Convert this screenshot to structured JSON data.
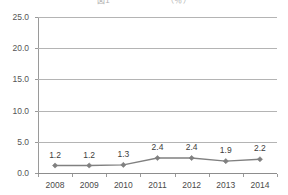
{
  "chart_data": {
    "type": "line",
    "title": "図1　　　　　　　（％）",
    "xlabel": "",
    "ylabel": "",
    "categories": [
      "2008",
      "2009",
      "2010",
      "2011",
      "2012",
      "2013",
      "2014"
    ],
    "values": [
      1.2,
      1.2,
      1.3,
      2.4,
      2.4,
      1.9,
      2.2
    ],
    "point_labels": [
      "1.2",
      "1.2",
      "1.3",
      "2.4",
      "2.4",
      "1.9",
      "2.2"
    ],
    "ylim": [
      0.0,
      25.0
    ],
    "yticks": [
      0.0,
      5.0,
      10.0,
      15.0,
      20.0,
      25.0
    ],
    "ytick_labels": [
      "0.0",
      "5.0",
      "10.0",
      "15.0",
      "20.0",
      "25.0"
    ],
    "grid": true,
    "legend": null,
    "series": [
      {
        "name": "series-1",
        "values": [
          1.2,
          1.2,
          1.3,
          2.4,
          2.4,
          1.9,
          2.2
        ],
        "color": "#808080",
        "marker": "diamond"
      }
    ],
    "colors": {
      "line": "#808080",
      "marker": "#808080",
      "grid": "#b4b4b4",
      "axis": "#8d8d8d",
      "text": "#3c3c3c",
      "background": "#ffffff"
    }
  }
}
